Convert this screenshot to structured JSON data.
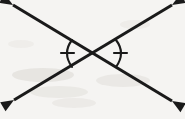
{
  "figure": {
    "title": "Vertical angles formed by two intersecting lines",
    "type": "geometry-diagram",
    "width": 185,
    "height": 119,
    "background_color": "#f5f4f2",
    "stroke_color": "#1a1a1a",
    "stroke_width": 3,
    "intersection_point": {
      "x": 94,
      "y": 53
    },
    "lines": [
      {
        "name": "line-upper-left-to-lower-right",
        "x1": 13,
        "y1": 5,
        "x2": 172,
        "y2": 101,
        "arrow_start": true,
        "arrow_end": true
      },
      {
        "name": "line-lower-left-to-upper-right",
        "x1": 14,
        "y1": 100,
        "x2": 172,
        "y2": 5,
        "arrow_start": true,
        "arrow_end": true
      }
    ],
    "arrowheads": [
      {
        "name": "arrowhead-upper-left",
        "x": 13,
        "y": 5,
        "angle_deg": 211
      },
      {
        "name": "arrowhead-upper-right",
        "x": 172,
        "y": 5,
        "angle_deg": 329
      },
      {
        "name": "arrowhead-lower-left",
        "x": 14,
        "y": 100,
        "angle_deg": 149
      },
      {
        "name": "arrowhead-lower-right",
        "x": 172,
        "y": 101,
        "angle_deg": 31
      }
    ],
    "angle_marks": [
      {
        "name": "angle-arc-left",
        "position": "left",
        "tick_count": 1,
        "arc_path": "M 72 40 Q 62 53 72 67",
        "tick": {
          "x1": 61,
          "y1": 53,
          "x2": 74,
          "y2": 53
        }
      },
      {
        "name": "angle-arc-right",
        "position": "right",
        "tick_count": 1,
        "arc_path": "M 116 40 Q 126 53 116 67",
        "tick": {
          "x1": 114,
          "y1": 53,
          "x2": 127,
          "y2": 53
        }
      }
    ],
    "scan_artifacts": [
      {
        "x": 12,
        "y": 68,
        "w": 62,
        "h": 14,
        "color": "rgba(176,170,162,0.20)"
      },
      {
        "x": 30,
        "y": 86,
        "w": 58,
        "h": 12,
        "color": "rgba(182,176,168,0.17)"
      },
      {
        "x": 96,
        "y": 74,
        "w": 54,
        "h": 13,
        "color": "rgba(178,172,164,0.16)"
      },
      {
        "x": 52,
        "y": 98,
        "w": 44,
        "h": 10,
        "color": "rgba(186,180,172,0.14)"
      },
      {
        "x": 120,
        "y": 20,
        "w": 30,
        "h": 9,
        "color": "rgba(188,182,176,0.12)"
      },
      {
        "x": 8,
        "y": 40,
        "w": 26,
        "h": 8,
        "color": "rgba(188,182,176,0.11)"
      }
    ]
  }
}
